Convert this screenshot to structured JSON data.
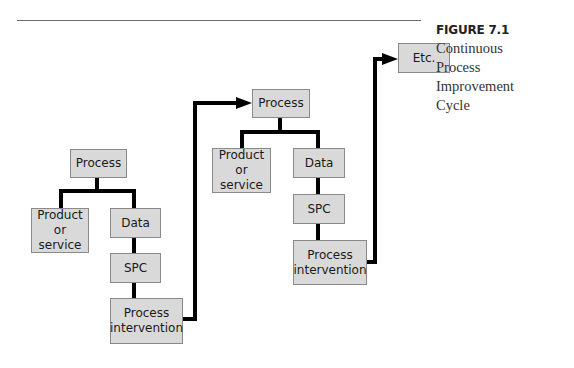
{
  "figure": {
    "number": "FIGURE 7.1",
    "caption_lines": [
      "Continuous",
      "Process",
      "Improvement",
      "Cycle"
    ]
  },
  "diagram": {
    "cycle_1": {
      "process": "Process",
      "product": "Product\nor service",
      "data": "Data",
      "spc": "SPC",
      "intervention": "Process\nintervention"
    },
    "cycle_2": {
      "process": "Process",
      "product": "Product\nor service",
      "data": "Data",
      "spc": "SPC",
      "intervention": "Process\nintervention"
    },
    "next": "Etc."
  },
  "colors": {
    "box_fill": "#d9d9d9",
    "box_border": "#8a8a8a",
    "connector": "#000000"
  }
}
